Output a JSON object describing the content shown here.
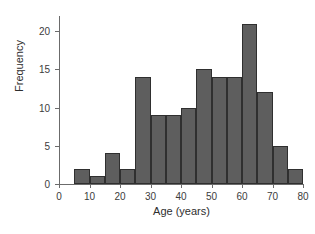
{
  "chart_data": {
    "type": "bar",
    "title": "",
    "xlabel": "Age (years)",
    "ylabel": "Frequency",
    "xlim": [
      0,
      80
    ],
    "ylim": [
      0,
      22
    ],
    "grid": false,
    "legend": null,
    "bin_width": 5,
    "bin_edges": [
      5,
      10,
      15,
      20,
      25,
      30,
      35,
      40,
      45,
      50,
      55,
      60,
      65,
      70,
      75,
      80
    ],
    "categories": [
      "5-10",
      "10-15",
      "15-20",
      "20-25",
      "25-30",
      "30-35",
      "35-40",
      "40-45",
      "45-50",
      "50-55",
      "55-60",
      "60-65",
      "65-70",
      "70-75",
      "75-80"
    ],
    "values": [
      2,
      1,
      4,
      2,
      14,
      9,
      9,
      10,
      15,
      14,
      14,
      21,
      12,
      5,
      2
    ],
    "bars": [
      {
        "x0": 5,
        "x1": 10,
        "value": 2
      },
      {
        "x0": 10,
        "x1": 15,
        "value": 1
      },
      {
        "x0": 15,
        "x1": 20,
        "value": 4
      },
      {
        "x0": 20,
        "x1": 25,
        "value": 2
      },
      {
        "x0": 25,
        "x1": 30,
        "value": 14
      },
      {
        "x0": 30,
        "x1": 35,
        "value": 9
      },
      {
        "x0": 35,
        "x1": 40,
        "value": 9
      },
      {
        "x0": 40,
        "x1": 45,
        "value": 10
      },
      {
        "x0": 45,
        "x1": 50,
        "value": 15
      },
      {
        "x0": 50,
        "x1": 55,
        "value": 14
      },
      {
        "x0": 55,
        "x1": 60,
        "value": 14
      },
      {
        "x0": 60,
        "x1": 65,
        "value": 21
      },
      {
        "x0": 65,
        "x1": 70,
        "value": 12
      },
      {
        "x0": 70,
        "x1": 75,
        "value": 5
      },
      {
        "x0": 75,
        "x1": 80,
        "value": 2
      }
    ],
    "xticks": [
      0,
      10,
      20,
      30,
      40,
      50,
      60,
      70,
      80
    ],
    "xticklabels": [
      "0",
      "10",
      "20",
      "30",
      "40",
      "50",
      "60",
      "70",
      "80"
    ],
    "yticks": [
      0,
      5,
      10,
      15,
      20
    ],
    "yticklabels": [
      "0",
      "5",
      "10",
      "15",
      "20"
    ],
    "colors": {
      "bar_fill": "#5e5e5e",
      "bar_edge": "#2f2f2f",
      "axis": "#6b6b6b",
      "text": "#2e2e2e",
      "background": "#ffffff"
    }
  }
}
